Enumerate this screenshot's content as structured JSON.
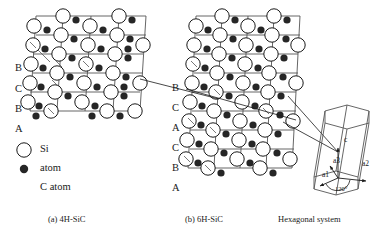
{
  "figure": {
    "panels": [
      {
        "id": "4h-sic",
        "caption": "(a) 4H-SiC",
        "stacking": [
          "B",
          "C",
          "B",
          "A"
        ],
        "rows": 6,
        "cols": 4
      },
      {
        "id": "6h-sic",
        "caption": "(b) 6H-SiC",
        "stacking": [
          "B",
          "C",
          "A",
          "C",
          "B",
          "A"
        ],
        "rows": 8,
        "cols": 4
      },
      {
        "id": "hexagonal-system",
        "caption": "Hexagonal system",
        "axes": [
          {
            "name": "c"
          },
          {
            "name": "a1"
          },
          {
            "name": "a2"
          },
          {
            "name": "a3"
          }
        ],
        "angle": "120"
      }
    ],
    "legend": {
      "si_symbol": "open-circle",
      "c_symbol": "filled-circle",
      "line1": "Si",
      "line2": "atom",
      "line3": "C atom"
    },
    "colors": {
      "si_fill": "#ffffff",
      "si_stroke": "#1a1a1a",
      "c_fill": "#262626",
      "lattice_line": "#555555",
      "leader_line": "#1a1a1a",
      "background": "#ffffff"
    }
  }
}
